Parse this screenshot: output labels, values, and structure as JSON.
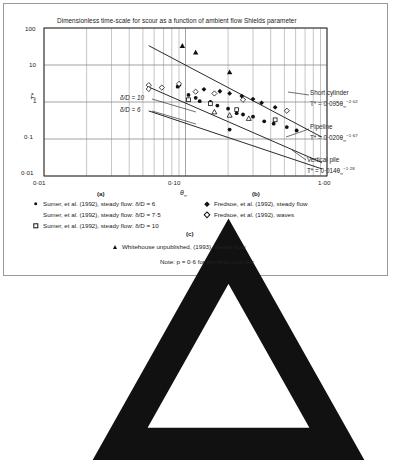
{
  "chart_data": {
    "type": "scatter",
    "title": "Dimensionless time-scale for scour as a function of ambient flow Shields parameter",
    "xlabel": "θ∞",
    "ylabel": "T*",
    "xscale": "log",
    "yscale": "log",
    "xlim": [
      0.01,
      1.0
    ],
    "ylim": [
      0.01,
      100
    ],
    "xticks": [
      "0·01",
      "0·10",
      "1·00"
    ],
    "xtick_values": [
      0.01,
      0.1,
      1.0
    ],
    "yticks": [
      "0·01",
      "0·1",
      "1",
      "10",
      "100"
    ],
    "ytick_values": [
      0.01,
      0.1,
      1,
      10,
      100
    ],
    "grid": true,
    "legend_position": "below-axes",
    "series": [
      {
        "name": "Sumer, et al. (1992), steady flow: δ/D = 6",
        "marker": "filled-circle",
        "points": [
          [
            0.088,
            2.6
          ],
          [
            0.105,
            1.55
          ],
          [
            0.118,
            1.3
          ],
          [
            0.126,
            1.05
          ],
          [
            0.15,
            1.0
          ],
          [
            0.168,
            0.8
          ],
          [
            0.2,
            0.66
          ],
          [
            0.205,
            0.18
          ],
          [
            0.23,
            0.5
          ],
          [
            0.255,
            0.46
          ],
          [
            0.3,
            0.4
          ],
          [
            0.36,
            0.3
          ],
          [
            0.42,
            0.26
          ],
          [
            0.52,
            0.21
          ],
          [
            0.61,
            0.17
          ]
        ]
      },
      {
        "name": "Sumer, et al. (1992), steady flow: δ/D = 7·5",
        "marker": "open-triangle",
        "points": [
          [
            0.16,
            0.54
          ],
          [
            0.205,
            0.44
          ],
          [
            0.28,
            0.36
          ]
        ]
      },
      {
        "name": "Sumer, et al. (1992), steady flow: δ/D = 10",
        "marker": "open-square",
        "points": [
          [
            0.105,
            1.15
          ],
          [
            0.15,
            0.9
          ],
          [
            0.23,
            0.62
          ],
          [
            0.43,
            0.33
          ]
        ]
      },
      {
        "name": "Fredsoe, et al. (1992), steady flow",
        "marker": "filled-diamond",
        "points": [
          [
            0.09,
            2.8
          ],
          [
            0.135,
            2.2
          ],
          [
            0.175,
            1.95
          ],
          [
            0.205,
            1.7
          ],
          [
            0.25,
            1.45
          ],
          [
            0.3,
            1.2
          ],
          [
            0.345,
            0.95
          ],
          [
            0.43,
            0.72
          ]
        ]
      },
      {
        "name": "Fredsoe, et al. (1992), waves",
        "marker": "open-diamond",
        "points": [
          [
            0.055,
            2.85
          ],
          [
            0.055,
            2.25
          ],
          [
            0.068,
            2.45
          ],
          [
            0.09,
            3.1
          ],
          [
            0.118,
            1.9
          ],
          [
            0.16,
            1.7
          ],
          [
            0.255,
            1.15
          ],
          [
            0.52,
            0.58
          ]
        ]
      },
      {
        "name": "Whitehouse unpublished, (1993), steady flow",
        "marker": "filled-triangle",
        "points": [
          [
            0.095,
            33.0
          ],
          [
            0.118,
            22.0
          ],
          [
            0.205,
            6.4
          ]
        ]
      }
    ],
    "trend_lines": [
      {
        "name": "Short cylinder",
        "equation": "T* = 0·095θ∞⁻²·⁰²",
        "coefficient": 0.095,
        "exponent": -2.02,
        "label_lines": [
          "Short cylinder",
          "T* = 0·095θ",
          "−2·02"
        ]
      },
      {
        "name": "Pipeline",
        "equation": "T* = 0·020θ∞⁻¹·⁶⁷",
        "coefficient": 0.02,
        "exponent": -1.67,
        "label_lines": [
          "Pipeline",
          "T* = 0·020θ",
          "−1·67"
        ]
      },
      {
        "name": "Vertical pile",
        "equation": "T* = 0·014θ∞⁻¹·²⁸",
        "coefficient": 0.014,
        "exponent": -1.28,
        "label_lines": [
          "Vertical pile",
          "T* = 0·014θ",
          "−1·28"
        ]
      }
    ],
    "inline_annotations": [
      {
        "text": "δ/D = 10"
      },
      {
        "text": "δ/D = 6"
      }
    ],
    "note": "Note: p = 0·6 for the short cylinder"
  },
  "title": "Dimensionless time-scale for scour as a function of ambient flow Shields parameter",
  "axes": {
    "y_label": "T*",
    "x_label_theta": "θ",
    "x_label_sub": "∞",
    "x_ticks": [
      "0·01",
      "0·10",
      "1·00"
    ],
    "y_ticks": [
      "100",
      "10",
      "1",
      "0·1",
      "0·01"
    ]
  },
  "annotations": {
    "delta_d_10": "δ/D = 10",
    "delta_d_6": "δ/D = 6",
    "short_cylinder_name": "Short cylinder",
    "short_cylinder_eq_head": "T* = 0·095θ",
    "short_cylinder_eq_sub": "∞",
    "short_cylinder_eq_exp": "−2·02",
    "pipeline_name": "Pipeline",
    "pipeline_eq_head": "T* = 0·020θ",
    "pipeline_eq_sub": "∞",
    "pipeline_eq_exp": "−1·67",
    "vertical_pile_name": "Vertical pile",
    "vertical_pile_eq_head": "T* = 0·014θ",
    "vertical_pile_eq_sub": "∞",
    "vertical_pile_eq_exp": "−1·28"
  },
  "legend": {
    "group_a_label": "(a)",
    "group_b_label": "(b)",
    "group_c_label": "(c)",
    "items_a": [
      "Sumer, et al. (1992), steady flow: δ/D = 6",
      "Sumer, et al. (1992), steady flow: δ/D = 7·5",
      "Sumer, et al. (1992), steady flow: δ/D = 10"
    ],
    "items_b": [
      "Fredsoe, et al. (1992), steady flow",
      "Fredsoe, et al. (1992), waves"
    ],
    "items_c": [
      "Whitehouse unpublished, (1993), steady flow"
    ],
    "note": "Note: p = 0·6 for the short cylinder"
  }
}
